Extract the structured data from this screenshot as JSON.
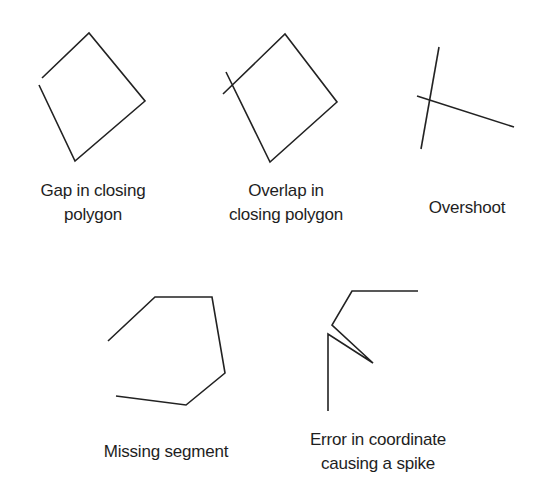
{
  "figures": [
    {
      "id": "gap",
      "label_lines": [
        "Gap in closing",
        "polygon"
      ],
      "paths": [
        [
          [
            42,
            78
          ],
          [
            89,
            33
          ],
          [
            145,
            101
          ],
          [
            75,
            161
          ],
          [
            39,
            85
          ]
        ]
      ]
    },
    {
      "id": "overlap",
      "label_lines": [
        "Overlap in",
        "closing polygon"
      ],
      "paths": [
        [
          [
            223,
            94
          ],
          [
            285,
            34
          ],
          [
            337,
            102
          ],
          [
            270,
            162
          ],
          [
            226,
            72
          ]
        ]
      ]
    },
    {
      "id": "overshoot",
      "label_lines": [
        "Overshoot"
      ],
      "paths": [
        [
          [
            439,
            47
          ],
          [
            421,
            149
          ]
        ],
        [
          [
            417,
            96
          ],
          [
            514,
            127
          ]
        ]
      ]
    },
    {
      "id": "missing",
      "label_lines": [
        "Missing segment"
      ],
      "paths": [
        [
          [
            108,
            341
          ],
          [
            155,
            297
          ],
          [
            212,
            297
          ],
          [
            225,
            373
          ],
          [
            186,
            405
          ],
          [
            116,
            396
          ]
        ]
      ]
    },
    {
      "id": "spike",
      "label_lines": [
        "Error in coordinate",
        "causing a spike"
      ],
      "paths": [
        [
          [
            418,
            291
          ],
          [
            352,
            291
          ],
          [
            332,
            325
          ],
          [
            373,
            363
          ],
          [
            328,
            334
          ],
          [
            328,
            411
          ]
        ]
      ]
    }
  ],
  "stroke_color": "#222222"
}
